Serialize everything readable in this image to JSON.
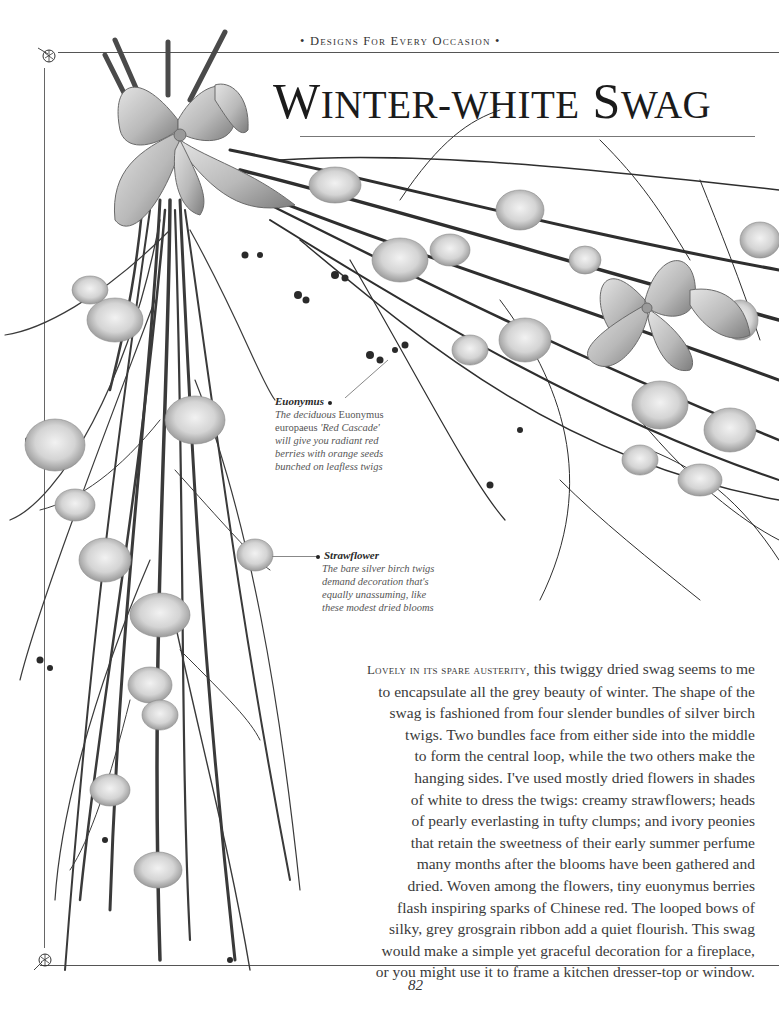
{
  "header": {
    "running_head": "Designs For Every Occasion",
    "bullet": "•"
  },
  "title": {
    "text": "Winter-white Swag",
    "part1_cap": "W",
    "part1_rest": "INTER-WHITE",
    "part2_cap": "S",
    "part2_rest": "WAG"
  },
  "illustration": {
    "subject": "dried winter-white swag of silver birch twigs with strawflowers, everlasting, peonies and grey ribbon bows",
    "palette": {
      "twig_dark": "#2b2b2b",
      "twig_mid": "#5a5a5a",
      "flower_light": "#dcdcdc",
      "flower_shade": "#a8a8a8",
      "ribbon_light": "#c9c9c9",
      "ribbon_shade": "#8a8a8a"
    }
  },
  "captions": [
    {
      "id": "euonymus",
      "heading": "Euonymus",
      "lines": [
        {
          "italic": "The deciduous ",
          "upright": "Euonymus"
        },
        {
          "upright": "europaeus ",
          "italic": "'Red Cascade'"
        },
        {
          "italic": "will give you radiant red"
        },
        {
          "italic": "berries with orange seeds"
        },
        {
          "italic": "bunched on leafless twigs"
        }
      ]
    },
    {
      "id": "strawflower",
      "heading": "Strawflower",
      "lines": [
        {
          "italic": "The bare silver birch twigs"
        },
        {
          "italic": "demand decoration that's"
        },
        {
          "italic": "equally unassuming, like"
        },
        {
          "italic": "these modest dried blooms"
        }
      ]
    }
  ],
  "body": {
    "lead_in": "Lovely in its spare austerity,",
    "lines": [
      " this twiggy dried swag seems to me",
      "to encapsulate all the grey beauty of winter. The shape of the",
      "swag is fashioned from four slender bundles of silver birch",
      "twigs. Two bundles face from either side into the middle",
      "to form the central loop, while the two others make the",
      "hanging sides. I've used mostly dried flowers in shades",
      "of white to dress the twigs: creamy strawflowers; heads",
      "of pearly everlasting in tufty clumps; and ivory peonies",
      "that retain the sweetness of their early summer perfume",
      "many months after the blooms have been gathered and",
      "dried. Woven among the flowers, tiny euonymus berries",
      "flash inspiring sparks of Chinese red. The looped bows of",
      "silky, grey grosgrain ribbon add a quiet flourish. This swag",
      "would make a simple yet graceful decoration for a fireplace,",
      "or you might use it to frame a kitchen dresser-top or window."
    ]
  },
  "footer": {
    "page_number": "82"
  },
  "ornaments": {
    "top_left": "flower-sprig",
    "bottom_left": "flower-sprig"
  }
}
